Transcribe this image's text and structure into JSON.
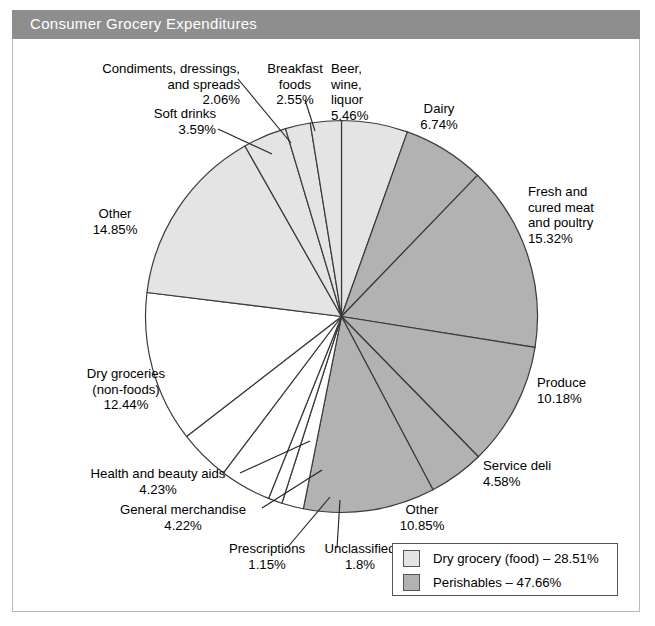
{
  "header": {
    "title": "Consumer Grocery Expenditures"
  },
  "chart_data": {
    "type": "pie",
    "title": "Consumer Grocery Expenditures",
    "unit": "percent",
    "start_angle_deg": 0,
    "direction": "clockwise",
    "total_labeled": 100.02,
    "categories": [
      "Beer, wine, liquor",
      "Dairy",
      "Fresh and cured meat and poultry",
      "Produce",
      "Service deli",
      "Other",
      "Unclassified",
      "Prescriptions",
      "General merchandise",
      "Health and beauty aids",
      "Dry groceries (non-foods)",
      "Other",
      "Soft drinks",
      "Condiments, dressings, and spreads",
      "Breakfast foods"
    ],
    "values": [
      5.46,
      6.74,
      15.32,
      10.18,
      4.58,
      10.85,
      1.8,
      1.15,
      4.22,
      4.23,
      12.44,
      14.85,
      3.59,
      2.06,
      2.55
    ],
    "slices": [
      {
        "label": "Beer, wine, liquor",
        "value": 5.46,
        "value_text": "5.46%",
        "group": "dry-grocery-food",
        "color": "#e4e4e4"
      },
      {
        "label": "Dairy",
        "value": 6.74,
        "value_text": "6.74%",
        "group": "perishables",
        "color": "#b2b2b2"
      },
      {
        "label": "Fresh and cured meat and poultry",
        "value": 15.32,
        "value_text": "15.32%",
        "group": "perishables",
        "color": "#b2b2b2"
      },
      {
        "label": "Produce",
        "value": 10.18,
        "value_text": "10.18%",
        "group": "perishables",
        "color": "#b2b2b2"
      },
      {
        "label": "Service deli",
        "value": 4.58,
        "value_text": "4.58%",
        "group": "perishables",
        "color": "#b2b2b2"
      },
      {
        "label": "Other",
        "value": 10.85,
        "value_text": "10.85%",
        "group": "perishables",
        "color": "#b2b2b2"
      },
      {
        "label": "Unclassified",
        "value": 1.8,
        "value_text": "1.8%",
        "group": "other",
        "color": "#ffffff"
      },
      {
        "label": "Prescriptions",
        "value": 1.15,
        "value_text": "1.15%",
        "group": "other",
        "color": "#ffffff"
      },
      {
        "label": "General merchandise",
        "value": 4.22,
        "value_text": "4.22%",
        "group": "other",
        "color": "#ffffff"
      },
      {
        "label": "Health and beauty aids",
        "value": 4.23,
        "value_text": "4.23%",
        "group": "other",
        "color": "#ffffff"
      },
      {
        "label": "Dry groceries (non-foods)",
        "value": 12.44,
        "value_text": "12.44%",
        "group": "other",
        "color": "#ffffff"
      },
      {
        "label": "Other",
        "value": 14.85,
        "value_text": "14.85%",
        "group": "dry-grocery-food",
        "color": "#e4e4e4"
      },
      {
        "label": "Soft drinks",
        "value": 3.59,
        "value_text": "3.59%",
        "group": "dry-grocery-food",
        "color": "#e4e4e4"
      },
      {
        "label": "Condiments, dressings, and spreads",
        "value": 2.06,
        "value_text": "2.06%",
        "group": "dry-grocery-food",
        "color": "#e4e4e4"
      },
      {
        "label": "Breakfast foods",
        "value": 2.55,
        "value_text": "2.55%",
        "group": "dry-grocery-food",
        "color": "#e4e4e4"
      }
    ],
    "legend": {
      "position": "bottom-right",
      "entries": [
        {
          "text": "Dry grocery (food) – 28.51%",
          "label": "Dry grocery (food)",
          "value": 28.51,
          "color": "#e4e4e4"
        },
        {
          "text": "Perishables – 47.66%",
          "label": "Perishables",
          "value": 47.66,
          "color": "#b2b2b2"
        }
      ]
    }
  },
  "labels": {
    "condiments": "Condiments, dressings,\nand spreads\n2.06%",
    "breakfast": "Breakfast\nfoods\n2.55%",
    "beer": "Beer,\nwine,\nliquor\n5.46%",
    "dairy": "Dairy\n6.74%",
    "soft_drinks": "Soft drinks\n3.59%",
    "fresh_meat": "Fresh and\ncured meat\nand poultry\n15.32%",
    "other_dry": "Other\n14.85%",
    "produce": "Produce\n10.18%",
    "dry_groceries": "Dry groceries\n(non-foods)\n12.44%",
    "service_deli": "Service deli\n4.58%",
    "health_beauty": "Health and beauty aids\n4.23%",
    "general_merchandise": "General merchandise\n4.22%",
    "other_perishables": "Other\n10.85%",
    "prescriptions": "Prescriptions\n1.15%",
    "unclassified": "Unclassified\n1.8%"
  },
  "colors": {
    "title_bar": "#8e8e8e",
    "title_text": "#ffffff",
    "frame_border": "#b9b9b9",
    "dry_grocery_food": "#e4e4e4",
    "perishables": "#b2b2b2",
    "other_white": "#ffffff",
    "slice_outline": "#3a3a3a"
  }
}
